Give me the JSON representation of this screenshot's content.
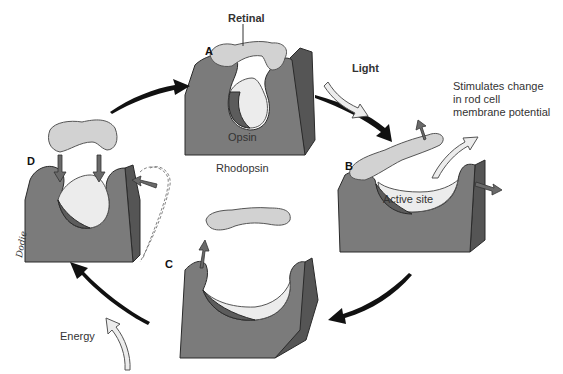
{
  "figure": {
    "stages": {
      "A": {
        "letter": "A",
        "label": "Rhodopsin",
        "protein_label": "Opsin",
        "chromophore_label": "Retinal"
      },
      "B": {
        "letter": "B",
        "site_label": "Active site"
      },
      "C": {
        "letter": "C"
      },
      "D": {
        "letter": "D"
      }
    },
    "inputs": {
      "light": "Light",
      "energy": "Energy"
    },
    "outcome": {
      "line1": "Stimulates change",
      "line2": "in rod cell",
      "line3": "membrane potential"
    },
    "signature": "Dodie",
    "colors": {
      "protein": "#7b7b7b",
      "protein_edge": "#555555",
      "retinal": "#d2d2d2",
      "cycle_arrow": "#111111"
    }
  }
}
